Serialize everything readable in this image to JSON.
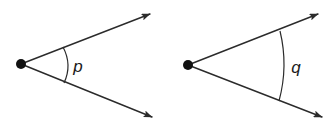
{
  "figure": {
    "type": "geometry-angle-comparison",
    "background_color": "#ffffff",
    "stroke_color": "#2b2b2b",
    "label_color": "#1a1a1a",
    "width": 335,
    "height": 130,
    "angles": [
      {
        "id": "angle-p",
        "label": "p",
        "vertex": {
          "x": 21,
          "y": 64
        },
        "vertex_dot_radius": 5,
        "rays": [
          {
            "name": "upper-ray",
            "from": {
              "x": 21,
              "y": 64
            },
            "to": {
              "x": 150,
              "y": 14
            },
            "arrowhead": "open-filled"
          },
          {
            "name": "lower-ray",
            "from": {
              "x": 21,
              "y": 64
            },
            "to": {
              "x": 152,
              "y": 117
            },
            "arrowhead": "open-filled"
          }
        ],
        "arc": {
          "radius": 47,
          "start": {
            "x": 63,
            "y": 47
          },
          "end": {
            "x": 64,
            "y": 83
          },
          "apex_x": 68
        },
        "label_position": {
          "x": 78,
          "y": 72
        },
        "measure_description": "smaller angle"
      },
      {
        "id": "angle-q",
        "label": "q",
        "vertex": {
          "x": 188,
          "y": 65
        },
        "vertex_dot_radius": 5,
        "rays": [
          {
            "name": "upper-ray",
            "from": {
              "x": 188,
              "y": 65
            },
            "to": {
              "x": 318,
              "y": 14
            },
            "arrowhead": "open-filled"
          },
          {
            "name": "lower-ray",
            "from": {
              "x": 188,
              "y": 65
            },
            "to": {
              "x": 322,
              "y": 117
            },
            "arrowhead": "open-filled"
          }
        ],
        "arc": {
          "radius": 95,
          "start": {
            "x": 280,
            "y": 31
          },
          "end": {
            "x": 279,
            "y": 101
          },
          "apex_x": 284
        },
        "label_position": {
          "x": 296,
          "y": 73
        },
        "measure_description": "larger arc radius, same angle opening"
      }
    ]
  }
}
